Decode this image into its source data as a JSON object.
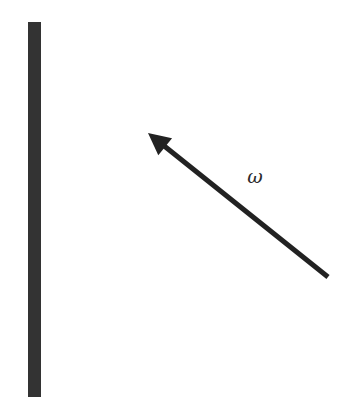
{
  "diagram": {
    "width": 351,
    "height": 418,
    "background": "#ffffff",
    "wall": {
      "x": 28,
      "y": 22,
      "width": 13,
      "height": 375,
      "color": "#333333"
    },
    "arrow": {
      "tail": {
        "x": 328,
        "y": 277
      },
      "tip": {
        "x": 148,
        "y": 133
      },
      "stroke_width": 5,
      "color": "#222222"
    },
    "label": {
      "text": "ω",
      "x": 255,
      "y": 183
    }
  }
}
